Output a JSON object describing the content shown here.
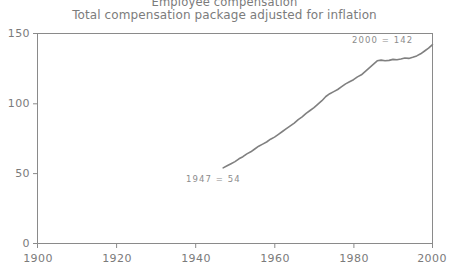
{
  "chart_data": {
    "type": "line",
    "title": "Employee compensation",
    "subtitle": "Total compensation package adjusted for inflation",
    "xlabel": "",
    "ylabel": "",
    "xlim": [
      1900,
      2000
    ],
    "ylim": [
      0,
      150
    ],
    "xticks": [
      1900,
      1920,
      1940,
      1960,
      1980,
      2000
    ],
    "yticks": [
      0,
      50,
      100,
      150
    ],
    "grid": false,
    "legend": "none",
    "line_color": "#808080",
    "series": [
      {
        "name": "Total compensation (index, inflation adjusted)",
        "x": [
          1947,
          1948,
          1949,
          1950,
          1951,
          1952,
          1953,
          1954,
          1955,
          1956,
          1957,
          1958,
          1959,
          1960,
          1961,
          1962,
          1963,
          1964,
          1965,
          1966,
          1967,
          1968,
          1969,
          1970,
          1971,
          1972,
          1973,
          1974,
          1975,
          1976,
          1977,
          1978,
          1979,
          1980,
          1981,
          1982,
          1983,
          1984,
          1985,
          1986,
          1987,
          1988,
          1989,
          1990,
          1991,
          1992,
          1993,
          1994,
          1995,
          1996,
          1997,
          1998,
          1999,
          2000
        ],
        "y": [
          54,
          55.5,
          57,
          58.5,
          60.5,
          62,
          64,
          65.5,
          67.5,
          69.5,
          71,
          72.5,
          74.5,
          76,
          78,
          80,
          82,
          84,
          86,
          88.5,
          90.5,
          93,
          95,
          97,
          99.5,
          102,
          105,
          107,
          108.5,
          110,
          112,
          114,
          115.5,
          117,
          119,
          120.5,
          123,
          125.5,
          128,
          130.5,
          131,
          130.5,
          130.8,
          131.5,
          131.2,
          131.8,
          132.5,
          132.2,
          133,
          134,
          135.5,
          137.5,
          139.5,
          142
        ]
      }
    ],
    "annotations": [
      {
        "name": "start-point",
        "text": "1947 = 54",
        "x": 1947,
        "y": 54
      },
      {
        "name": "end-point",
        "text": "2000 = 142",
        "x": 2000,
        "y": 142
      }
    ]
  },
  "axis": {
    "ytick_labels": [
      "150",
      "100",
      "50",
      "0"
    ],
    "xtick_labels": [
      "1900",
      "1920",
      "1940",
      "1960",
      "1980",
      "2000"
    ]
  },
  "annotations": {
    "start_label": "1947 = 54",
    "end_label": "2000 = 142"
  }
}
